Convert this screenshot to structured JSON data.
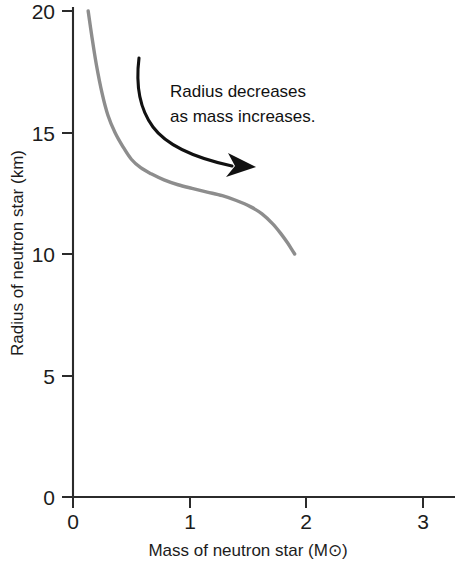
{
  "figure": {
    "background_color": "#ffffff",
    "axis_color": "#2b2b2b",
    "curve_color": "#8d8d8d",
    "annotation_color": "#111111"
  },
  "axes": {
    "x_title": "Mass of neutron star (M⊙)",
    "y_title": "Radius of neutron star (km)",
    "x_ticks": [
      "0",
      "1",
      "2",
      "3"
    ],
    "y_ticks": [
      "0",
      "5",
      "10",
      "15",
      "20"
    ]
  },
  "annotation": {
    "line1": "Radius decreases",
    "line2": "as mass increases."
  },
  "chart_data": {
    "type": "line",
    "title": "",
    "subtitle": "",
    "xlabel": "Mass of neutron star (M⊙)",
    "ylabel": "Radius of neutron star (km)",
    "xlim": [
      0,
      3.25
    ],
    "ylim": [
      0,
      20
    ],
    "xticks": [
      0,
      1,
      2,
      3
    ],
    "yticks": [
      0,
      5,
      10,
      15,
      20
    ],
    "grid": false,
    "legend": null,
    "legend_position": "none",
    "series": [
      {
        "name": "Neutron star mass-radius relation",
        "color": "#8d8d8d",
        "x": [
          0.13,
          0.16,
          0.2,
          0.25,
          0.3,
          0.36,
          0.43,
          0.5,
          0.58,
          0.67,
          0.78,
          0.9,
          1.02,
          1.15,
          1.28,
          1.4,
          1.52,
          1.62,
          1.71,
          1.78,
          1.84,
          1.88,
          1.9
        ],
        "y": [
          20.0,
          19.0,
          17.8,
          16.6,
          15.7,
          15.0,
          14.4,
          13.9,
          13.55,
          13.3,
          13.05,
          12.85,
          12.7,
          12.55,
          12.4,
          12.2,
          11.95,
          11.65,
          11.25,
          10.85,
          10.45,
          10.15,
          10.0
        ]
      }
    ],
    "annotations": [
      {
        "text": "Radius decreases as mass increases.",
        "type": "curved-arrow-callout",
        "arrow_start": [
          0.57,
          18.3
        ],
        "arrow_end": [
          1.52,
          13.6
        ]
      }
    ]
  }
}
